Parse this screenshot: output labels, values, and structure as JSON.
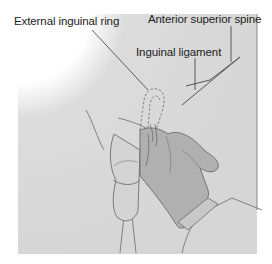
{
  "figure": {
    "type": "anatomical-illustration",
    "labels": {
      "external_ring": "External inguinal ring",
      "anterior_superior_spine": "Anterior superior spine",
      "inguinal_ligament": "Inguinal ligament"
    },
    "colors": {
      "background": "#ffffff",
      "skin": "#d9d9d9",
      "glove": "#b3b3b3",
      "outline": "#6e6e6e",
      "leader_line": "#3a3a3a"
    }
  }
}
